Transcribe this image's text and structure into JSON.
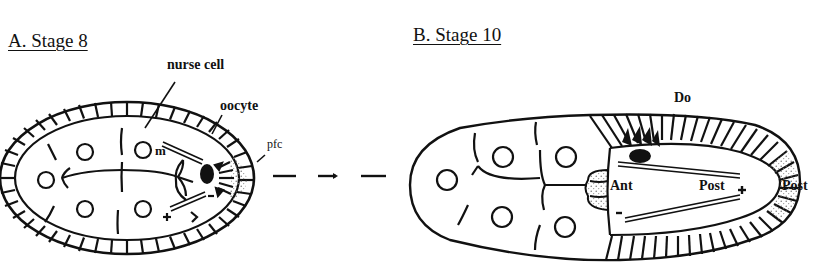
{
  "panels": {
    "a": {
      "title": "A. Stage 8",
      "labels": {
        "nurse_cell": "nurse cell",
        "oocyte": "oocyte",
        "pfc": "pfc",
        "m": "m",
        "plus": "+",
        "minus": "-"
      }
    },
    "b": {
      "title": "B. Stage 10",
      "labels": {
        "do": "Do",
        "ant": "Ant",
        "post_inner": "Post",
        "post_outer": "Post",
        "plus": "+",
        "minus": "-"
      }
    }
  },
  "connector": {
    "style": "dashed-arrow",
    "from": "A. Stage 8",
    "to": "B. Stage 10"
  },
  "colors": {
    "ink": "#111111",
    "background": "#ffffff",
    "stipple": "#777777"
  }
}
